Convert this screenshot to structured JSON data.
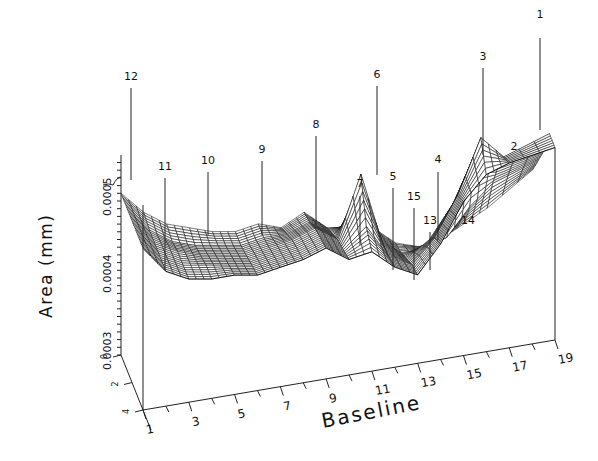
{
  "chart_data": {
    "type": "surface3d",
    "title": "",
    "xlabel": "Baseline",
    "ylabel": "Area (mm)",
    "zlabel": "",
    "x_ticks": [
      1,
      3,
      5,
      7,
      9,
      11,
      13,
      15,
      17,
      19
    ],
    "y_ticks": [
      "0.0003",
      "0.0004",
      "0.0005"
    ],
    "y_range": [
      0.0003,
      0.00058
    ],
    "depth_ticks": [
      "0",
      "2",
      "4"
    ],
    "grid": false,
    "render_style": "wireframe mesh",
    "x": [
      1,
      2,
      3,
      4,
      5,
      6,
      7,
      8,
      9,
      10,
      11,
      12,
      13,
      14,
      15,
      16,
      17,
      19
    ],
    "depth_rows": [
      0,
      1,
      2,
      3,
      4
    ],
    "surface": [
      [
        0.00051,
        0.00048,
        0.00046,
        0.00045,
        0.00044,
        0.000435,
        0.00044,
        0.00043,
        0.000445,
        0.00042,
        0.000415,
        0.00041,
        0.000385,
        0.000375,
        0.00038,
        0.000395,
        0.00041,
        0.00045
      ],
      [
        0.00051,
        0.000475,
        0.000455,
        0.000445,
        0.00044,
        0.000435,
        0.00044,
        0.00044,
        0.00045,
        0.00043,
        0.000445,
        0.000415,
        0.00039,
        0.00039,
        0.0004,
        0.000435,
        0.00046,
        0.00048
      ],
      [
        0.00051,
        0.000475,
        0.00046,
        0.00045,
        0.000445,
        0.00044,
        0.000445,
        0.00045,
        0.00046,
        0.00044,
        0.00052,
        0.00042,
        0.0004,
        0.00042,
        0.00046,
        0.00052,
        0.0005,
        0.00051
      ],
      [
        0.00051,
        0.000475,
        0.00046,
        0.000455,
        0.00045,
        0.000445,
        0.00045,
        0.000455,
        0.000465,
        0.000445,
        0.00047,
        0.000425,
        0.00041,
        0.00044,
        0.00049,
        0.00056,
        0.00053,
        0.00055
      ],
      [
        0.00051,
        0.000475,
        0.00046,
        0.000455,
        0.000455,
        0.00045,
        0.000455,
        0.00046,
        0.00047,
        0.00045,
        0.000455,
        0.00043,
        0.000415,
        0.00045,
        0.0005,
        0.00053,
        0.00054,
        0.00055
      ]
    ],
    "peak_labels": [
      {
        "label": "1",
        "baseline": 19,
        "lx": 540,
        "ly": 18,
        "top": 38,
        "bottom": 130
      },
      {
        "label": "2",
        "baseline": 18,
        "lx": 514,
        "ly": 150,
        "top": 0,
        "bottom": 0
      },
      {
        "label": "3",
        "baseline": 16,
        "lx": 483,
        "ly": 60,
        "top": 68,
        "bottom": 155
      },
      {
        "label": "4",
        "baseline": 14,
        "lx": 438,
        "ly": 163,
        "top": 172,
        "bottom": 240
      },
      {
        "label": "5",
        "baseline": 12,
        "lx": 393,
        "ly": 180,
        "top": 188,
        "bottom": 270
      },
      {
        "label": "6",
        "baseline": 11,
        "lx": 377,
        "ly": 78,
        "top": 86,
        "bottom": 175
      },
      {
        "label": "7",
        "baseline": 10,
        "lx": 360,
        "ly": 187,
        "top": 196,
        "bottom": 245
      },
      {
        "label": "8",
        "baseline": 9,
        "lx": 316,
        "ly": 128,
        "top": 136,
        "bottom": 225
      },
      {
        "label": "9",
        "baseline": 7,
        "lx": 262,
        "ly": 153,
        "top": 161,
        "bottom": 235
      },
      {
        "label": "10",
        "baseline": 5,
        "lx": 208,
        "ly": 164,
        "top": 172,
        "bottom": 235
      },
      {
        "label": "11",
        "baseline": 3,
        "lx": 165,
        "ly": 170,
        "top": 178,
        "bottom": 270
      },
      {
        "label": "12",
        "baseline": 1,
        "lx": 131,
        "ly": 80,
        "top": 88,
        "bottom": 180
      },
      {
        "label": "13",
        "baseline": 13,
        "lx": 430,
        "ly": 224,
        "top": 232,
        "bottom": 270
      },
      {
        "label": "14",
        "baseline": 15,
        "lx": 468,
        "ly": 224,
        "top": 0,
        "bottom": 0
      },
      {
        "label": "15",
        "baseline": 12,
        "lx": 414,
        "ly": 200,
        "top": 208,
        "bottom": 280
      }
    ]
  },
  "labels": {
    "xlabel": "Baseline",
    "ylabel": "Area (mm)"
  }
}
